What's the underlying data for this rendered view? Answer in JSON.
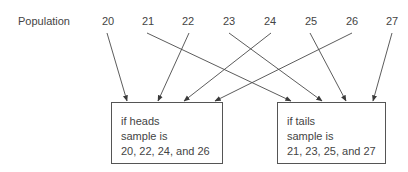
{
  "diagram": {
    "row_label": "Population",
    "population": [
      {
        "value": "20",
        "x": 108
      },
      {
        "value": "21",
        "x": 148
      },
      {
        "value": "22",
        "x": 188
      },
      {
        "value": "23",
        "x": 229
      },
      {
        "value": "24",
        "x": 270
      },
      {
        "value": "25",
        "x": 311
      },
      {
        "value": "26",
        "x": 352
      },
      {
        "value": "27",
        "x": 392
      }
    ],
    "boxes": {
      "heads": {
        "line1": "if heads",
        "line2": "sample is",
        "line3": "20, 22, 24, and 26"
      },
      "tails": {
        "line1": "if tails",
        "line2": "sample is",
        "line3": "21, 23, 25, and 27"
      }
    },
    "arrows": [
      {
        "from": "20",
        "to": "heads"
      },
      {
        "from": "22",
        "to": "heads"
      },
      {
        "from": "24",
        "to": "heads"
      },
      {
        "from": "26",
        "to": "heads"
      },
      {
        "from": "21",
        "to": "tails"
      },
      {
        "from": "23",
        "to": "tails"
      },
      {
        "from": "25",
        "to": "tails"
      },
      {
        "from": "27",
        "to": "tails"
      }
    ],
    "colors": {
      "line": "#4a4a4a",
      "text": "#444444"
    }
  }
}
